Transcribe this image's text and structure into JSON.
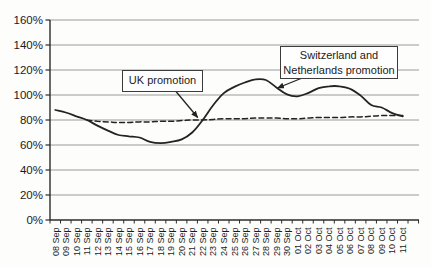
{
  "chart_data": {
    "type": "line",
    "title": "",
    "xlabel": "",
    "ylabel": "",
    "ylim": [
      0,
      160
    ],
    "grid": "horizontal",
    "y_ticks": [
      "0%",
      "20%",
      "40%",
      "60%",
      "80%",
      "100%",
      "120%",
      "140%",
      "160%"
    ],
    "categories": [
      "08 Sep",
      "09 Sep",
      "10 Sep",
      "11 Sep",
      "12 Sep",
      "13 Sep",
      "14 Sep",
      "15 Sep",
      "16 Sep",
      "17 Sep",
      "18 Sep",
      "19 Sep",
      "20 Sep",
      "21 Sep",
      "22 Sep",
      "23 Sep",
      "24 Sep",
      "25 Sep",
      "26 Sep",
      "27 Sep",
      "28 Sep",
      "29 Sep",
      "30 Sep",
      "01 Oct",
      "02 Oct",
      "03 Oct",
      "04 Oct",
      "05 Oct",
      "06 Oct",
      "07 Oct",
      "08 Oct",
      "09 Oct",
      "10 Oct",
      "11 Oct"
    ],
    "series": [
      {
        "name": "actual-percentage-solid-line",
        "style": "solid",
        "values": [
          88,
          86,
          83,
          80,
          75.5,
          71.5,
          68,
          67,
          66,
          62.5,
          61.5,
          62.5,
          64.5,
          70,
          80,
          92,
          101.5,
          106.5,
          110,
          112.5,
          112,
          106,
          100.5,
          99,
          101.5,
          105.5,
          107,
          107,
          105,
          99.5,
          92,
          90,
          85.5,
          83
        ]
      },
      {
        "name": "reference-percentage-dashed-line",
        "style": "dashed",
        "values": [
          null,
          null,
          null,
          80,
          79,
          78.5,
          78,
          78,
          78.5,
          78.5,
          79,
          79,
          79.5,
          80,
          80,
          80.5,
          81,
          81,
          81,
          81.5,
          81.5,
          81.5,
          81,
          81,
          81.5,
          82,
          82,
          82,
          82.5,
          82.5,
          83,
          83.5,
          83.5,
          83.5
        ]
      }
    ],
    "annotations": [
      {
        "text": "UK promotion",
        "target_category": "22 Sep",
        "target_value": 80
      },
      {
        "text": "Switzerland and Netherlands promotion",
        "target_category": "29 Sep",
        "target_value": 106
      }
    ],
    "colors": {
      "line": "#232323",
      "gridline": "#9a9a9a",
      "axis": "#2b2b2b",
      "text": "#1b1b1b",
      "background": "#fdfdfc"
    }
  }
}
